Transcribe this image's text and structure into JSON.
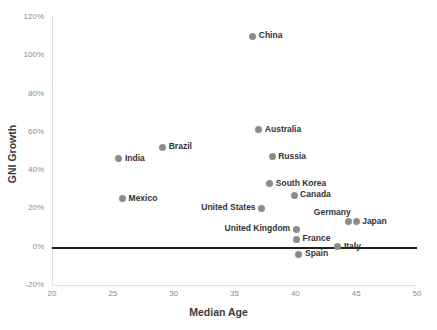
{
  "chart_data": {
    "type": "scatter",
    "title": "",
    "xlabel": "Median Age",
    "ylabel": "GNI Growth",
    "xlim": [
      20,
      50
    ],
    "ylim": [
      -0.2,
      1.2
    ],
    "grid": false,
    "legend": "none",
    "x_ticks": [
      "20",
      "25",
      "30",
      "35",
      "40",
      "45",
      "50"
    ],
    "y_ticks": [
      "120%",
      "100%",
      "80%",
      "60%",
      "40%",
      "20%",
      "0%",
      "-20%"
    ],
    "x_tick_values": [
      20,
      25,
      30,
      35,
      40,
      45,
      50
    ],
    "y_tick_values": [
      1.2,
      1.0,
      0.8,
      0.6,
      0.4,
      0.2,
      0.0,
      -0.2
    ],
    "annotations": [
      "zero reference line at 0%"
    ],
    "points": [
      {
        "name": "China",
        "x": 36.5,
        "y": 1.1,
        "label_pos": "right"
      },
      {
        "name": "Australia",
        "x": 37.0,
        "y": 0.61,
        "label_pos": "right"
      },
      {
        "name": "Brazil",
        "x": 29.1,
        "y": 0.52,
        "label_pos": "right"
      },
      {
        "name": "India",
        "x": 25.5,
        "y": 0.46,
        "label_pos": "right"
      },
      {
        "name": "Russia",
        "x": 38.1,
        "y": 0.47,
        "label_pos": "right"
      },
      {
        "name": "South Korea",
        "x": 37.9,
        "y": 0.33,
        "label_pos": "right"
      },
      {
        "name": "Canada",
        "x": 39.9,
        "y": 0.27,
        "label_pos": "right"
      },
      {
        "name": "Mexico",
        "x": 25.8,
        "y": 0.25,
        "label_pos": "right"
      },
      {
        "name": "United States",
        "x": 37.2,
        "y": 0.2,
        "label_pos": "left"
      },
      {
        "name": "Germany",
        "x": 44.4,
        "y": 0.13,
        "label_pos": "above"
      },
      {
        "name": "Japan",
        "x": 45.0,
        "y": 0.13,
        "label_pos": "right"
      },
      {
        "name": "United Kingdom",
        "x": 40.1,
        "y": 0.09,
        "label_pos": "left"
      },
      {
        "name": "France",
        "x": 40.1,
        "y": 0.04,
        "label_pos": "right"
      },
      {
        "name": "Italy",
        "x": 43.5,
        "y": 0.0,
        "label_pos": "right"
      },
      {
        "name": "Spain",
        "x": 40.3,
        "y": -0.04,
        "label_pos": "right"
      }
    ]
  }
}
